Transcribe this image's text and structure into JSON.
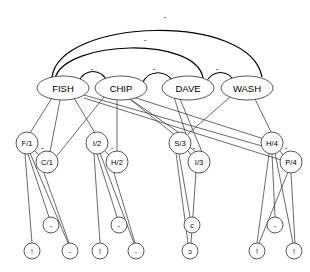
{
  "diagram": {
    "background": "#ffffff",
    "edge_color": "#2b2b2b",
    "node_stroke": "#3a3a3a",
    "node_fill": "#ffffff",
    "sign_label": "-"
  },
  "top_nodes": [
    {
      "id": "fish",
      "label": "FISH",
      "cx": 63,
      "cy": 88,
      "rx": 26,
      "ry": 12
    },
    {
      "id": "chip",
      "label": "CHIP",
      "cx": 121,
      "cy": 88,
      "rx": 26,
      "ry": 12
    },
    {
      "id": "dave",
      "label": "DAVE",
      "cx": 188,
      "cy": 88,
      "rx": 26,
      "ry": 12
    },
    {
      "id": "wash",
      "label": "WASH",
      "cx": 247,
      "cy": 88,
      "rx": 26,
      "ry": 12
    }
  ],
  "mid_nodes": [
    {
      "id": "f1",
      "label": "F/1",
      "cx": 27,
      "cy": 143,
      "r": 11
    },
    {
      "id": "c1",
      "label": "C/1",
      "cx": 47,
      "cy": 162,
      "r": 11
    },
    {
      "id": "i2",
      "label": "I/2",
      "cx": 97,
      "cy": 143,
      "r": 11
    },
    {
      "id": "h2",
      "label": "H/2",
      "cx": 117,
      "cy": 162,
      "r": 11
    },
    {
      "id": "s3",
      "label": "S/3",
      "cx": 180,
      "cy": 143,
      "r": 11
    },
    {
      "id": "i3",
      "label": "I/3",
      "cx": 199,
      "cy": 162,
      "r": 11
    },
    {
      "id": "h4",
      "label": "H/4",
      "cx": 272,
      "cy": 143,
      "r": 11
    },
    {
      "id": "p4",
      "label": "P/4",
      "cx": 291,
      "cy": 162,
      "r": 11
    }
  ],
  "leaf_nodes": [
    {
      "id": "l1",
      "label": "!",
      "cx": 32,
      "cy": 251,
      "r": 8
    },
    {
      "id": "l2",
      "label": "-",
      "cx": 51,
      "cy": 225,
      "r": 8
    },
    {
      "id": "l3",
      "label": "-",
      "cx": 70,
      "cy": 251,
      "r": 8
    },
    {
      "id": "l4",
      "label": "!",
      "cx": 100,
      "cy": 251,
      "r": 8
    },
    {
      "id": "l5",
      "label": "-",
      "cx": 119,
      "cy": 225,
      "r": 8
    },
    {
      "id": "l6",
      "label": "-",
      "cx": 136,
      "cy": 251,
      "r": 8
    },
    {
      "id": "l7",
      "label": "c",
      "cx": 192,
      "cy": 225,
      "r": 8
    },
    {
      "id": "l8",
      "label": "ɔ",
      "cx": 190,
      "cy": 251,
      "r": 8
    },
    {
      "id": "l9",
      "label": "!",
      "cx": 257,
      "cy": 251,
      "r": 8
    },
    {
      "id": "l10",
      "label": "-",
      "cx": 275,
      "cy": 225,
      "r": 8
    },
    {
      "id": "l11",
      "label": "!",
      "cx": 294,
      "cy": 251,
      "r": 8
    }
  ],
  "pair_signs": [
    {
      "id": "sign-f1-c1",
      "label": "-",
      "x": 42,
      "y": 150
    },
    {
      "id": "sign-i2-h2",
      "label": "-",
      "x": 112,
      "y": 150
    },
    {
      "id": "sign-s3-i3",
      "label": "-",
      "x": 194,
      "y": 150
    },
    {
      "id": "sign-h4-p4",
      "label": "-",
      "x": 286,
      "y": 150
    }
  ],
  "arc_signs": [
    {
      "id": "sign-arc-fish-chip",
      "label": "-",
      "x": 92,
      "y": 71
    },
    {
      "id": "sign-arc-chip-dave",
      "label": "-",
      "x": 154,
      "y": 71
    },
    {
      "id": "sign-arc-dave-wash",
      "label": "-",
      "x": 217,
      "y": 71
    },
    {
      "id": "sign-arc-long-inner",
      "label": "-",
      "x": 145,
      "y": 42
    },
    {
      "id": "sign-arc-long-outer",
      "label": "-",
      "x": 165,
      "y": 19
    }
  ]
}
